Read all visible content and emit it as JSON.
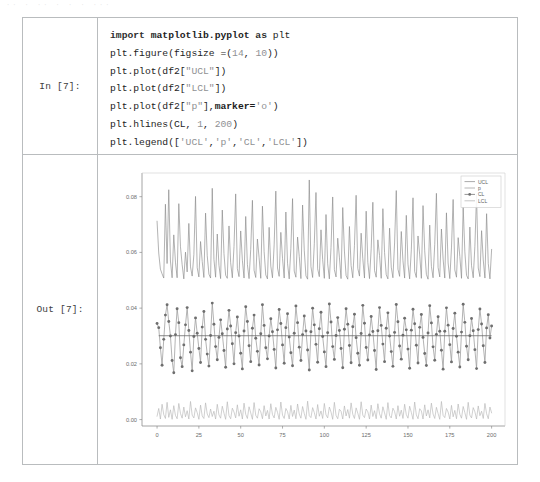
{
  "scan_artifact": {
    "text": "·· ·  ··   · · ·  ···"
  },
  "notebook": {
    "input_cell": {
      "prompt": "In [7]:",
      "code_lines": [
        {
          "tokens": [
            {
              "t": "import ",
              "c": "tok-kw"
            },
            {
              "t": "matplotlib.pyplot",
              "c": "tok-mod"
            },
            {
              "t": " as ",
              "c": "tok-kw"
            },
            {
              "t": "plt",
              "c": "tok-plain"
            }
          ],
          "plain": "import matplotlib.pyplot as plt"
        },
        {
          "tokens": [
            {
              "t": "plt.figure(figsize =(",
              "c": "tok-plain"
            },
            {
              "t": "14",
              "c": "tok-num"
            },
            {
              "t": ", ",
              "c": "tok-plain"
            },
            {
              "t": "10",
              "c": "tok-num"
            },
            {
              "t": "))",
              "c": "tok-plain"
            }
          ],
          "plain": "plt.figure(figsize =(14, 10))"
        },
        {
          "tokens": [
            {
              "t": "plt.plot(df2[",
              "c": "tok-plain"
            },
            {
              "t": "\"UCL\"",
              "c": "tok-str"
            },
            {
              "t": "])",
              "c": "tok-plain"
            }
          ],
          "plain": "plt.plot(df2[\"UCL\"])"
        },
        {
          "tokens": [
            {
              "t": "plt.plot(df2[",
              "c": "tok-plain"
            },
            {
              "t": "\"LCL\"",
              "c": "tok-str"
            },
            {
              "t": "])",
              "c": "tok-plain"
            }
          ],
          "plain": "plt.plot(df2[\"LCL\"])"
        },
        {
          "tokens": [
            {
              "t": "plt.plot(df2[",
              "c": "tok-plain"
            },
            {
              "t": "\"p\"",
              "c": "tok-str"
            },
            {
              "t": "],",
              "c": "tok-plain"
            },
            {
              "t": "marker=",
              "c": "tok-bold"
            },
            {
              "t": "'o'",
              "c": "tok-str"
            },
            {
              "t": ")",
              "c": "tok-plain"
            }
          ],
          "plain": "plt.plot(df2[\"p\"],marker='o')"
        },
        {
          "tokens": [
            {
              "t": "plt.hlines(CL, ",
              "c": "tok-plain"
            },
            {
              "t": "1",
              "c": "tok-num"
            },
            {
              "t": ", ",
              "c": "tok-plain"
            },
            {
              "t": "200",
              "c": "tok-num"
            },
            {
              "t": ")",
              "c": "tok-plain"
            }
          ],
          "plain": "plt.hlines(CL, 1, 200)"
        },
        {
          "tokens": [
            {
              "t": "plt.legend([",
              "c": "tok-plain"
            },
            {
              "t": "'UCL'",
              "c": "tok-str"
            },
            {
              "t": ",",
              "c": "tok-plain"
            },
            {
              "t": "'p'",
              "c": "tok-str"
            },
            {
              "t": ",",
              "c": "tok-plain"
            },
            {
              "t": "'CL'",
              "c": "tok-str"
            },
            {
              "t": ",",
              "c": "tok-plain"
            },
            {
              "t": "'LCL'",
              "c": "tok-str"
            },
            {
              "t": "])",
              "c": "tok-plain"
            }
          ],
          "plain": "plt.legend(['UCL','p','CL','LCL'])"
        }
      ]
    },
    "output_cell": {
      "prompt": "Out [7]:"
    }
  },
  "chart_data": {
    "type": "line",
    "title": "",
    "xlabel": "",
    "ylabel": "",
    "xlim": [
      -9,
      208
    ],
    "ylim": [
      -0.0023,
      0.0885
    ],
    "xticks": [
      0,
      25,
      50,
      75,
      100,
      125,
      150,
      175,
      200
    ],
    "xtick_labels": [
      "0",
      "25",
      "50",
      "75",
      "100",
      "125",
      "150",
      "175",
      "200"
    ],
    "yticks": [
      0.0,
      0.02,
      0.04,
      0.06,
      0.08
    ],
    "ytick_labels": [
      "0.00",
      "0.02",
      "0.04",
      "0.06",
      "0.08"
    ],
    "grid": false,
    "legend_position": "upper-right",
    "legend": [
      {
        "label": "UCL",
        "marker": "none",
        "color": "#8e8e8e"
      },
      {
        "label": "p",
        "marker": "none",
        "color": "#9d9d9d"
      },
      {
        "label": "CL",
        "marker": "o",
        "color": "#6f6f6f"
      },
      {
        "label": "LCL",
        "marker": "none",
        "color": "#b4b4b4"
      }
    ],
    "center_line": {
      "name": "CL",
      "value": 0.0301,
      "x_from": 1,
      "x_to": 200,
      "color": "#6a6a6a"
    },
    "series": [
      {
        "name": "UCL",
        "color": "#8a8a8a",
        "marker": "none",
        "values": [
          0.0712,
          0.0598,
          0.054,
          0.0523,
          0.0508,
          0.0773,
          0.056,
          0.0825,
          0.0569,
          0.0509,
          0.0663,
          0.0565,
          0.0509,
          0.0775,
          0.062,
          0.0556,
          0.0505,
          0.0601,
          0.053,
          0.0704,
          0.0548,
          0.0515,
          0.0592,
          0.0801,
          0.0545,
          0.0512,
          0.0639,
          0.0567,
          0.051,
          0.0741,
          0.0588,
          0.0522,
          0.0508,
          0.083,
          0.0575,
          0.0511,
          0.0666,
          0.0554,
          0.0506,
          0.0752,
          0.0596,
          0.0518,
          0.0507,
          0.0695,
          0.0563,
          0.0509,
          0.0621,
          0.081,
          0.0542,
          0.0513,
          0.0677,
          0.0572,
          0.0508,
          0.0729,
          0.0557,
          0.0506,
          0.0611,
          0.0787,
          0.0536,
          0.051,
          0.0648,
          0.0581,
          0.0507,
          0.0766,
          0.0603,
          0.0519,
          0.0505,
          0.069,
          0.0551,
          0.0509,
          0.0627,
          0.082,
          0.0544,
          0.0514,
          0.0672,
          0.0579,
          0.0508,
          0.0745,
          0.0561,
          0.0505,
          0.0615,
          0.0793,
          0.0533,
          0.0511,
          0.0655,
          0.0586,
          0.0506,
          0.077,
          0.0608,
          0.0516,
          0.0504,
          0.086,
          0.0549,
          0.051,
          0.0631,
          0.0815,
          0.0541,
          0.0513,
          0.0681,
          0.0574,
          0.0507,
          0.0736,
          0.0559,
          0.0505,
          0.0618,
          0.0799,
          0.0538,
          0.0512,
          0.0651,
          0.0583,
          0.0506,
          0.0761,
          0.0605,
          0.0517,
          0.0504,
          0.0693,
          0.0553,
          0.0509,
          0.0624,
          0.0805,
          0.0543,
          0.0515,
          0.0669,
          0.0577,
          0.0508,
          0.0748,
          0.0564,
          0.0506,
          0.0613,
          0.078,
          0.0535,
          0.0511,
          0.0645,
          0.0589,
          0.0507,
          0.0757,
          0.06,
          0.052,
          0.0505,
          0.0687,
          0.0547,
          0.0509,
          0.0634,
          0.0822,
          0.054,
          0.0514,
          0.0675,
          0.057,
          0.0508,
          0.0733,
          0.0558,
          0.0505,
          0.0609,
          0.0796,
          0.0532,
          0.051,
          0.0659,
          0.0591,
          0.0507,
          0.0768,
          0.0606,
          0.0521,
          0.0504,
          0.0698,
          0.055,
          0.0509,
          0.0629,
          0.0812,
          0.0546,
          0.0512,
          0.0684,
          0.0576,
          0.0508,
          0.0742,
          0.0562,
          0.0506,
          0.0616,
          0.079,
          0.0537,
          0.0511,
          0.0653,
          0.0585,
          0.0507,
          0.0763,
          0.0602,
          0.0518,
          0.0505,
          0.0691,
          0.0552,
          0.0509,
          0.0622,
          0.0808,
          0.0544,
          0.0513,
          0.0678,
          0.0573,
          0.0508,
          0.0739,
          0.056,
          0.0505,
          0.0611
        ]
      },
      {
        "name": "p",
        "color": "#9a9a9a",
        "marker": "o",
        "marker_color": "#6e6e6e",
        "values": [
          0.0345,
          0.033,
          0.0258,
          0.0195,
          0.0288,
          0.0375,
          0.0412,
          0.0352,
          0.03,
          0.0212,
          0.0168,
          0.0305,
          0.0398,
          0.0348,
          0.0222,
          0.019,
          0.0268,
          0.034,
          0.0402,
          0.032,
          0.0242,
          0.0175,
          0.0298,
          0.0365,
          0.031,
          0.0255,
          0.0205,
          0.0332,
          0.0388,
          0.0288,
          0.0235,
          0.0192,
          0.0302,
          0.0418,
          0.0342,
          0.0262,
          0.0215,
          0.0295,
          0.0358,
          0.0308,
          0.0248,
          0.0188,
          0.0325,
          0.0392,
          0.0336,
          0.0272,
          0.02,
          0.0312,
          0.0368,
          0.03,
          0.0238,
          0.0182,
          0.0318,
          0.0405,
          0.0352,
          0.0265,
          0.0208,
          0.0328,
          0.0375,
          0.0292,
          0.0245,
          0.0196,
          0.0308,
          0.0412,
          0.0338,
          0.0258,
          0.0218,
          0.03,
          0.0362,
          0.0315,
          0.0252,
          0.0185,
          0.0322,
          0.0395,
          0.0345,
          0.0268,
          0.0202,
          0.033,
          0.038,
          0.0296,
          0.024,
          0.0193,
          0.031,
          0.0408,
          0.0348,
          0.026,
          0.0212,
          0.0305,
          0.0372,
          0.0318,
          0.025,
          0.0178,
          0.0315,
          0.04,
          0.034,
          0.027,
          0.0206,
          0.0326,
          0.0385,
          0.0298,
          0.0243,
          0.019,
          0.0312,
          0.0415,
          0.035,
          0.0262,
          0.0216,
          0.0302,
          0.0366,
          0.032,
          0.0255,
          0.0186,
          0.0324,
          0.0398,
          0.0342,
          0.0266,
          0.0204,
          0.0333,
          0.0378,
          0.0294,
          0.0238,
          0.0195,
          0.0309,
          0.041,
          0.0346,
          0.0259,
          0.0214,
          0.0304,
          0.037,
          0.0316,
          0.0248,
          0.018,
          0.0319,
          0.0402,
          0.0338,
          0.0271,
          0.0208,
          0.0328,
          0.0383,
          0.03,
          0.0244,
          0.0191,
          0.0313,
          0.0413,
          0.0351,
          0.0264,
          0.0217,
          0.0303,
          0.0364,
          0.0322,
          0.0253,
          0.0184,
          0.0321,
          0.0396,
          0.0344,
          0.0267,
          0.0203,
          0.0331,
          0.0377,
          0.0295,
          0.0237,
          0.0194,
          0.0311,
          0.0409,
          0.0347,
          0.0261,
          0.0213,
          0.0306,
          0.0369,
          0.0317,
          0.0249,
          0.0181,
          0.0317,
          0.0401,
          0.0339,
          0.0269,
          0.0207,
          0.0327,
          0.0382,
          0.0299,
          0.0242,
          0.0189,
          0.0314,
          0.0414,
          0.0349,
          0.0263,
          0.0215,
          0.0301,
          0.0363,
          0.0319,
          0.0251,
          0.0183,
          0.0323,
          0.0397,
          0.0343,
          0.0265,
          0.0205,
          0.0329,
          0.0376,
          0.0293,
          0.0336
        ]
      },
      {
        "name": "LCL",
        "color": "#b6b6b6",
        "marker": "none",
        "values": [
          0.0012,
          0.004,
          0.0002,
          0.0055,
          0.0018,
          0.0004,
          0.0062,
          0.0008,
          0.0035,
          0.0001,
          0.005,
          0.0015,
          0.0003,
          0.0058,
          0.0022,
          0.0005,
          0.0045,
          0.001,
          0.0032,
          0.0002,
          0.0065,
          0.0016,
          0.0006,
          0.0042,
          0.0025,
          0.0001,
          0.0052,
          0.0013,
          0.0004,
          0.006,
          0.002,
          0.0007,
          0.0038,
          0.0011,
          0.003,
          0.0002,
          0.0055,
          0.0017,
          0.0005,
          0.0048,
          0.0023,
          0.0001,
          0.0064,
          0.0014,
          0.0003,
          0.0041,
          0.0027,
          0.0006,
          0.0053,
          0.0012,
          0.0035,
          0.0002,
          0.0059,
          0.0019,
          0.0004,
          0.0046,
          0.0024,
          0.0001,
          0.0061,
          0.0015,
          0.0005,
          0.0039,
          0.0028,
          0.0003,
          0.005,
          0.0013,
          0.0033,
          0.0002,
          0.0057,
          0.0018,
          0.0006,
          0.0044,
          0.0026,
          0.0001,
          0.0063,
          0.0016,
          0.0004,
          0.004,
          0.0029,
          0.0002,
          0.0051,
          0.0011,
          0.0034,
          0.0003,
          0.0056,
          0.002,
          0.0005,
          0.0047,
          0.0022,
          0.0001,
          0.0066,
          0.0014,
          0.0007,
          0.0043,
          0.0025,
          0.0002,
          0.0054,
          0.0012,
          0.0031,
          0.0004,
          0.0058,
          0.0017,
          0.0006,
          0.0045,
          0.0027,
          0.0001,
          0.0062,
          0.0015,
          0.0003,
          0.0037,
          0.003,
          0.0002,
          0.0049,
          0.0013,
          0.0036,
          0.0005,
          0.006,
          0.0019,
          0.0004,
          0.0042,
          0.0023,
          0.0001,
          0.0064,
          0.0016,
          0.0007,
          0.0038,
          0.0028,
          0.0002,
          0.0052,
          0.0011,
          0.0032,
          0.0003,
          0.0057,
          0.0021,
          0.0005,
          0.0046,
          0.0024,
          0.0001,
          0.0061,
          0.0014,
          0.0006,
          0.0041,
          0.0029,
          0.0002,
          0.005,
          0.0012,
          0.0034,
          0.0004,
          0.0055,
          0.0018,
          0.0005,
          0.0048,
          0.0026,
          0.0001,
          0.0063,
          0.0017,
          0.0003,
          0.0039,
          0.0031,
          0.0002,
          0.0053,
          0.0013,
          0.0035,
          0.0006,
          0.0059,
          0.002,
          0.0004,
          0.0044,
          0.0022,
          0.0001,
          0.0065,
          0.0015,
          0.0007,
          0.004,
          0.0027,
          0.0002,
          0.0051,
          0.001,
          0.0033,
          0.0003,
          0.0056,
          0.0019,
          0.0005,
          0.0047,
          0.0025,
          0.0001,
          0.0062,
          0.0016,
          0.0006,
          0.0043,
          0.0028,
          0.0002,
          0.0049,
          0.0014,
          0.003,
          0.0004,
          0.0058,
          0.0021,
          0.0003,
          0.0045,
          0.0024
        ]
      }
    ]
  }
}
